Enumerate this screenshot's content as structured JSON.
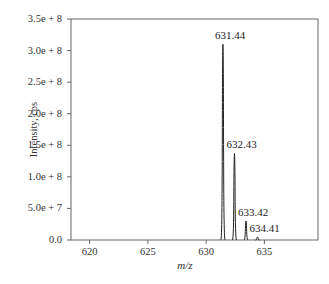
{
  "chart_data": {
    "type": "line",
    "title": "",
    "xlabel": "m/z",
    "ylabel": "Intensity, cps",
    "xlim": [
      618.4,
      639.6
    ],
    "ylim": [
      0,
      350000000
    ],
    "grid": false,
    "legend": null,
    "x_ticks": [
      "620",
      "625",
      "630",
      "635"
    ],
    "y_ticks": [
      "0.0",
      "5.0e + 7",
      "1.0e + 8",
      "1.5e + 8",
      "2.0e + 8",
      "2.5e + 8",
      "3.0e + 8",
      "3.5e + 8"
    ],
    "series": [
      {
        "name": "Isotope pattern",
        "peaks": [
          {
            "mz": 631.44,
            "intensity": 310000000,
            "label": "631.44"
          },
          {
            "mz": 632.43,
            "intensity": 137000000,
            "label": "632.43"
          },
          {
            "mz": 633.42,
            "intensity": 30000000,
            "label": "633.42"
          },
          {
            "mz": 634.41,
            "intensity": 5000000,
            "label": "634.41"
          }
        ]
      }
    ]
  }
}
